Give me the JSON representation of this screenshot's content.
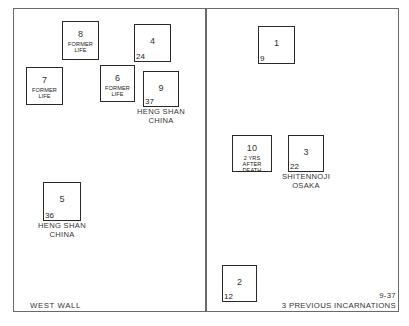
{
  "diagram": {
    "figure_id": "9-37",
    "title": "3 PREVIOUS INCARNATIONS",
    "left_panel": {
      "label": "WEST WALL"
    },
    "boxes": [
      {
        "id": "box-8",
        "number": "8",
        "note": "FORMER\nLIFE",
        "corner": "",
        "caption": "",
        "x": 62,
        "y": 21,
        "w": 37,
        "h": 39
      },
      {
        "id": "box-4",
        "number": "4",
        "note": "",
        "corner": "24",
        "caption": "",
        "x": 134,
        "y": 24,
        "w": 37,
        "h": 38
      },
      {
        "id": "box-7",
        "number": "7",
        "note": "FORMER\nLIFE",
        "corner": "",
        "caption": "",
        "x": 26,
        "y": 67,
        "w": 37,
        "h": 38
      },
      {
        "id": "box-6",
        "number": "6",
        "note": "FORMER\nLIFE",
        "corner": "",
        "caption": "",
        "x": 100,
        "y": 65,
        "w": 35,
        "h": 37
      },
      {
        "id": "box-9",
        "number": "9",
        "note": "",
        "corner": "37",
        "caption": "HENG SHAN\nCHINA",
        "x": 143,
        "y": 71,
        "w": 36,
        "h": 36
      },
      {
        "id": "box-5",
        "number": "5",
        "note": "",
        "corner": "36",
        "caption": "HENG SHAN\nCHINA",
        "x": 43,
        "y": 182,
        "w": 38,
        "h": 39
      },
      {
        "id": "box-1",
        "number": "1",
        "note": "",
        "corner": "9",
        "caption": "",
        "x": 258,
        "y": 26,
        "w": 37,
        "h": 38
      },
      {
        "id": "box-10",
        "number": "10",
        "note": "2 YRS\nAFTER DEATH",
        "corner": "",
        "caption": "",
        "x": 232,
        "y": 135,
        "w": 40,
        "h": 37
      },
      {
        "id": "box-3",
        "number": "3",
        "note": "",
        "corner": "22",
        "caption": "SHITENNOJI\nOSAKA",
        "x": 288,
        "y": 135,
        "w": 36,
        "h": 37
      },
      {
        "id": "box-2",
        "number": "2",
        "note": "",
        "corner": "12",
        "caption": "",
        "x": 222,
        "y": 265,
        "w": 35,
        "h": 37
      }
    ]
  }
}
